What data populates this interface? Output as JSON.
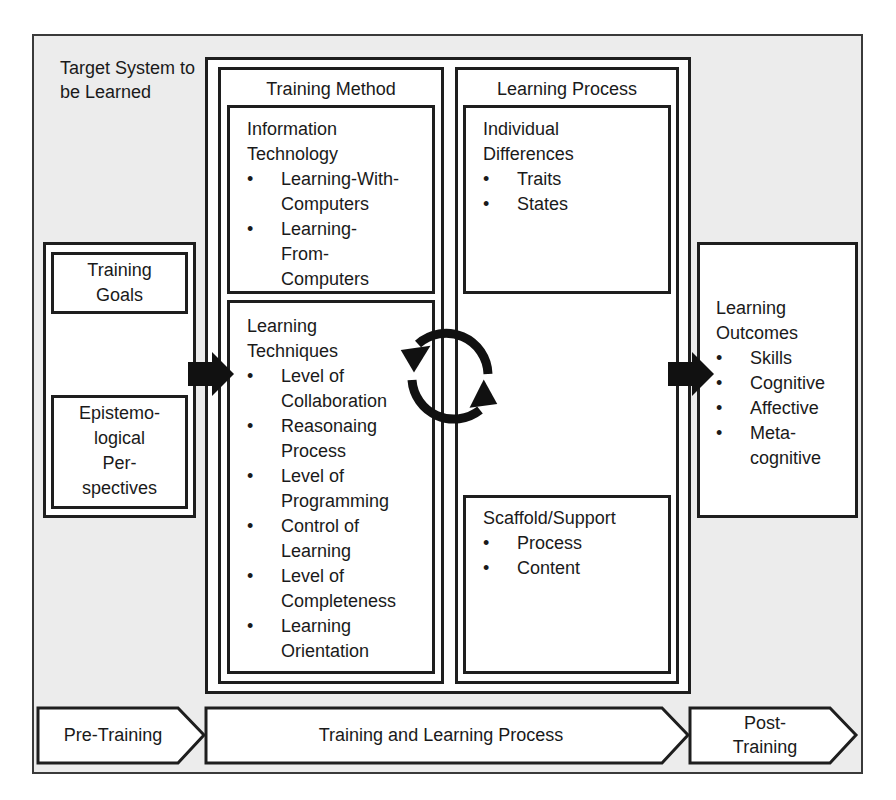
{
  "diagram": {
    "frame_label": "Target System to be Learned",
    "training_method": {
      "title": "Training Method",
      "information_technology": {
        "heading_line1": "Information",
        "heading_line2": "Technology",
        "items": [
          {
            "line1": "Learning-With-",
            "line2": "Computers"
          },
          {
            "line1": "Learning-",
            "line2": "From-",
            "line3": "Computers"
          }
        ]
      },
      "learning_techniques": {
        "heading_line1": "Learning",
        "heading_line2": "Techniques",
        "items": [
          {
            "line1": "Level of",
            "line2": "Collaboration"
          },
          {
            "line1": "Reasonaing",
            "line2": "Process"
          },
          {
            "line1": "Level of",
            "line2": "Programming"
          },
          {
            "line1": "Control of",
            "line2": "Learning"
          },
          {
            "line1": "Level of",
            "line2": "Completeness"
          },
          {
            "line1": "Learning",
            "line2": "Orientation"
          }
        ]
      }
    },
    "learning_process": {
      "title": "Learning Process",
      "individual_differences": {
        "heading_line1": "Individual",
        "heading_line2": "Differences",
        "items": [
          "Traits",
          "States"
        ]
      },
      "scaffold_support": {
        "heading": "Scaffold/Support",
        "items": [
          "Process",
          "Content"
        ]
      }
    },
    "inputs": {
      "training_goals": {
        "line1": "Training",
        "line2": "Goals"
      },
      "epistemological": {
        "line1": "Epistemo-",
        "line2": "logical",
        "line3": "Per-",
        "line4": "spectives"
      }
    },
    "outcomes": {
      "heading_line1": "Learning",
      "heading_line2": "Outcomes",
      "items": [
        {
          "line1": "Skills"
        },
        {
          "line1": "Cognitive"
        },
        {
          "line1": "Affective"
        },
        {
          "line1": "Meta-",
          "line2": "cognitive"
        }
      ]
    },
    "phases": {
      "pre": "Pre-Training",
      "main": "Training and Learning Process",
      "post_line1": "Post-",
      "post_line2": "Training"
    },
    "colors": {
      "frame_bg": "#ececec",
      "stroke": "#1e1e1e",
      "box_bg": "#ffffff"
    }
  }
}
